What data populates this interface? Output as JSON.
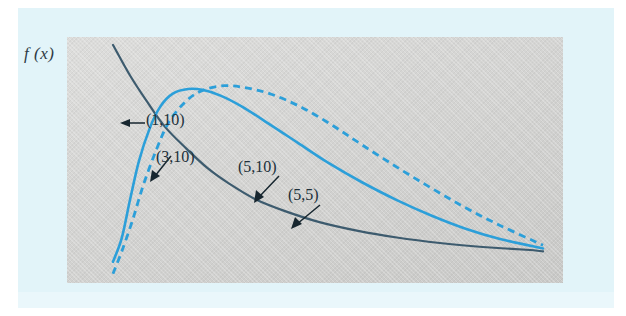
{
  "figure": {
    "y_axis_label": "f (x)",
    "panel_background_color": "#d4d4d2",
    "page_background_color": "#e2f4f9"
  },
  "annotations": [
    {
      "name": "annotation-1-10",
      "text": "(1,10)",
      "arrow": "left"
    },
    {
      "name": "annotation-3-10",
      "text": "(3,10)",
      "arrow": "down-left"
    },
    {
      "name": "annotation-5-10",
      "text": "(5,10)",
      "arrow": "down-left"
    },
    {
      "name": "annotation-5-5",
      "text": "(5,5)",
      "arrow": "down-left"
    }
  ],
  "chart_data": {
    "type": "line",
    "title": "",
    "xlabel": "",
    "ylabel": "f (x)",
    "grid": false,
    "legend": null,
    "axis_visible": false,
    "xlim": [
      0,
      10
    ],
    "ylim": [
      0,
      1
    ],
    "series": [
      {
        "name": "(1,10)",
        "style": "solid",
        "color": "#3d5b6e",
        "width": 2.2,
        "points": [
          [
            0.0,
            1.0
          ],
          [
            0.04,
            0.86
          ],
          [
            0.08,
            0.74
          ],
          [
            0.12,
            0.63
          ],
          [
            0.17,
            0.53
          ],
          [
            0.22,
            0.44
          ],
          [
            0.27,
            0.37
          ],
          [
            0.33,
            0.3
          ],
          [
            0.4,
            0.245
          ],
          [
            0.48,
            0.195
          ],
          [
            0.57,
            0.155
          ],
          [
            0.66,
            0.125
          ],
          [
            0.76,
            0.1
          ],
          [
            0.86,
            0.082
          ],
          [
            0.97,
            0.068
          ],
          [
            1.0,
            0.062
          ]
        ]
      },
      {
        "name": "(3,10)",
        "style": "solid",
        "color": "#2c9fd9",
        "width": 2.6,
        "points": [
          [
            0.0,
            0.015
          ],
          [
            0.02,
            0.12
          ],
          [
            0.04,
            0.3
          ],
          [
            0.06,
            0.47
          ],
          [
            0.085,
            0.62
          ],
          [
            0.11,
            0.72
          ],
          [
            0.14,
            0.78
          ],
          [
            0.175,
            0.8
          ],
          [
            0.21,
            0.795
          ],
          [
            0.25,
            0.77
          ],
          [
            0.3,
            0.72
          ],
          [
            0.36,
            0.645
          ],
          [
            0.43,
            0.555
          ],
          [
            0.5,
            0.465
          ],
          [
            0.58,
            0.375
          ],
          [
            0.66,
            0.295
          ],
          [
            0.74,
            0.225
          ],
          [
            0.82,
            0.165
          ],
          [
            0.9,
            0.118
          ],
          [
            1.0,
            0.075
          ]
        ]
      },
      {
        "name": "(5,10)",
        "style": "dashed",
        "color": "#2c9fd9",
        "width": 2.8,
        "points": [
          [
            0.0,
            -0.04
          ],
          [
            0.02,
            0.06
          ],
          [
            0.045,
            0.2
          ],
          [
            0.07,
            0.36
          ],
          [
            0.1,
            0.52
          ],
          [
            0.13,
            0.65
          ],
          [
            0.17,
            0.745
          ],
          [
            0.21,
            0.795
          ],
          [
            0.26,
            0.815
          ],
          [
            0.31,
            0.805
          ],
          [
            0.37,
            0.775
          ],
          [
            0.44,
            0.715
          ],
          [
            0.51,
            0.635
          ],
          [
            0.58,
            0.545
          ],
          [
            0.66,
            0.445
          ],
          [
            0.74,
            0.35
          ],
          [
            0.82,
            0.26
          ],
          [
            0.9,
            0.18
          ],
          [
            1.0,
            0.09
          ]
        ]
      },
      {
        "name": "(5,5)",
        "style": "solid-overlap-tail",
        "color": "#2c9fd9",
        "note": "shares the tail region with the (3,10) solid curve at the right of the panel"
      }
    ]
  }
}
